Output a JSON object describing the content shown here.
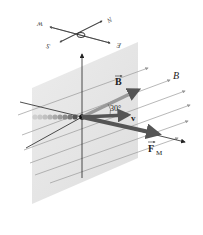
{
  "figure": {
    "compass": {
      "labels": [
        "W",
        "N",
        "S",
        "E"
      ]
    },
    "labels": {
      "field_vector": "B",
      "field_lines": "B",
      "angle": "30°",
      "velocity": "v",
      "force": "F",
      "force_subscript": "M"
    },
    "colors": {
      "plane": "#e6e6e6",
      "field_lines": "#9a9a9a",
      "vectors": "#555555",
      "axes": "#222222",
      "charge_trail": "#888888"
    }
  }
}
